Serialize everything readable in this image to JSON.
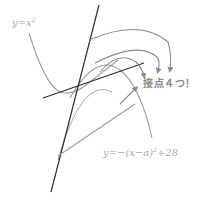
{
  "diagram": {
    "labels": {
      "upper_parabola": "y=x",
      "upper_parabola_exp": "2",
      "lower_parabola_main": "y=−(x−a)",
      "lower_parabola_exp": "2",
      "lower_parabola_tail": "+28",
      "callout": "接点４つ！"
    },
    "colors": {
      "background": "#ffffff",
      "tangent_lines": "#333333",
      "curves": "#9a9a9a",
      "arrows": "#8a8a8a",
      "label_text": "#a8a8a8"
    },
    "elements": [
      "parabola y=x^2",
      "parabola y=-(x-a)^2+28 (three positions)",
      "steep tangent line",
      "shallow tangent line",
      "arrows pointing to callout label"
    ]
  }
}
